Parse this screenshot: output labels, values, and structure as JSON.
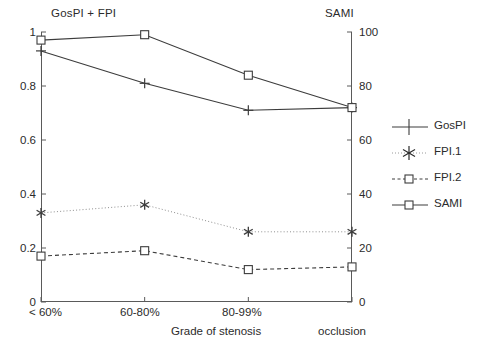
{
  "header": {
    "left_label": "GosPI + FPI",
    "right_label": "SAMI"
  },
  "axes": {
    "left_ticks": [
      "0",
      "0.2",
      "0.4",
      "0.6",
      "0.8",
      "1"
    ],
    "right_ticks": [
      "0",
      "20",
      "40",
      "60",
      "80",
      "100"
    ],
    "x_ticks": [
      "< 60%",
      "60-80%",
      "80-99%"
    ],
    "x_caption": "Grade of stenosis",
    "x_caption_right": "occlusion"
  },
  "legend": {
    "items": [
      {
        "label": "GosPI",
        "marker": "plus-marker",
        "line": "solid"
      },
      {
        "label": "FPI.1",
        "marker": "asterisk-marker",
        "line": "dotted"
      },
      {
        "label": "FPI.2",
        "marker": "square-marker",
        "line": "dashed"
      },
      {
        "label": "SAMI",
        "marker": "square-marker",
        "line": "solid"
      }
    ]
  },
  "chart_data": {
    "type": "line",
    "title": "",
    "subtitle": "",
    "xlabel": "Grade of stenosis",
    "ylabel": "GosPI + FPI",
    "ylabel_right": "SAMI",
    "categories": [
      "< 60%",
      "60-80%",
      "80-99%",
      "occlusion"
    ],
    "ylim": [
      0,
      1
    ],
    "ylim_right": [
      0,
      100
    ],
    "yticks": [
      0,
      0.2,
      0.4,
      0.6,
      0.8,
      1
    ],
    "yticks_right": [
      0,
      20,
      40,
      60,
      80,
      100
    ],
    "grid": false,
    "legend_position": "right",
    "series": [
      {
        "name": "GosPI",
        "axis": "left",
        "marker": "plus",
        "linestyle": "solid",
        "color": "#3c3c3c",
        "values": [
          0.93,
          0.81,
          0.71,
          0.72
        ]
      },
      {
        "name": "FPI.1",
        "axis": "left",
        "marker": "asterisk",
        "linestyle": "dotted",
        "color": "#3c3c3c",
        "values": [
          0.33,
          0.36,
          0.26,
          0.26
        ]
      },
      {
        "name": "FPI.2",
        "axis": "left",
        "marker": "square",
        "linestyle": "dashed",
        "color": "#3c3c3c",
        "values": [
          0.17,
          0.19,
          0.12,
          0.13
        ]
      },
      {
        "name": "SAMI",
        "axis": "right",
        "marker": "square",
        "linestyle": "solid",
        "color": "#3c3c3c",
        "values": [
          97,
          99,
          84,
          72
        ]
      }
    ]
  }
}
